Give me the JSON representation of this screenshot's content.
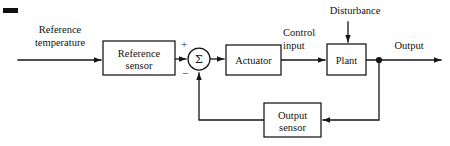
{
  "diagram": {
    "type": "control-system-block-diagram",
    "background_color": "#ffffff",
    "line_color": "#141414",
    "text_color": "#121212",
    "blocks": [
      {
        "id": "reference-sensor",
        "label_line1": "Reference",
        "label_line2": "sensor",
        "x": 103,
        "y": 41,
        "w": 72,
        "h": 34
      },
      {
        "id": "actuator",
        "label_line1": "Actuator",
        "label_line2": "",
        "x": 226,
        "y": 45,
        "w": 55,
        "h": 30
      },
      {
        "id": "plant",
        "label_line1": "Plant",
        "label_line2": "",
        "x": 327,
        "y": 44,
        "w": 39,
        "h": 31
      },
      {
        "id": "output-sensor",
        "label_line1": "Output",
        "label_line2": "sensor",
        "x": 264,
        "y": 103,
        "w": 57,
        "h": 34
      }
    ],
    "summing_junction": {
      "id": "summing-junction",
      "symbol": "Σ",
      "cx": 199,
      "cy": 59,
      "r": 11,
      "plus_sign": "+",
      "minus_sign": "−"
    },
    "signal_labels": [
      {
        "id": "reference-temperature",
        "line1": "Reference",
        "line2": "temperature",
        "x": 60,
        "y1": 33,
        "y2": 46
      },
      {
        "id": "control-input",
        "line1": "Control",
        "line2": "input",
        "x": 283,
        "y1": 36,
        "y2": 49
      },
      {
        "id": "disturbance",
        "line1": "Disturbance",
        "line2": "",
        "x": 355,
        "y1": 14,
        "y2": 0
      },
      {
        "id": "output",
        "line1": "Output",
        "line2": "",
        "x": 409,
        "y1": 49,
        "y2": 0
      }
    ],
    "junction_dots": [
      {
        "id": "output-tap",
        "cx": 379,
        "cy": 60
      }
    ],
    "artifact": {
      "id": "corner-dash",
      "x": 3,
      "y": 8,
      "w": 15,
      "h": 5
    }
  }
}
